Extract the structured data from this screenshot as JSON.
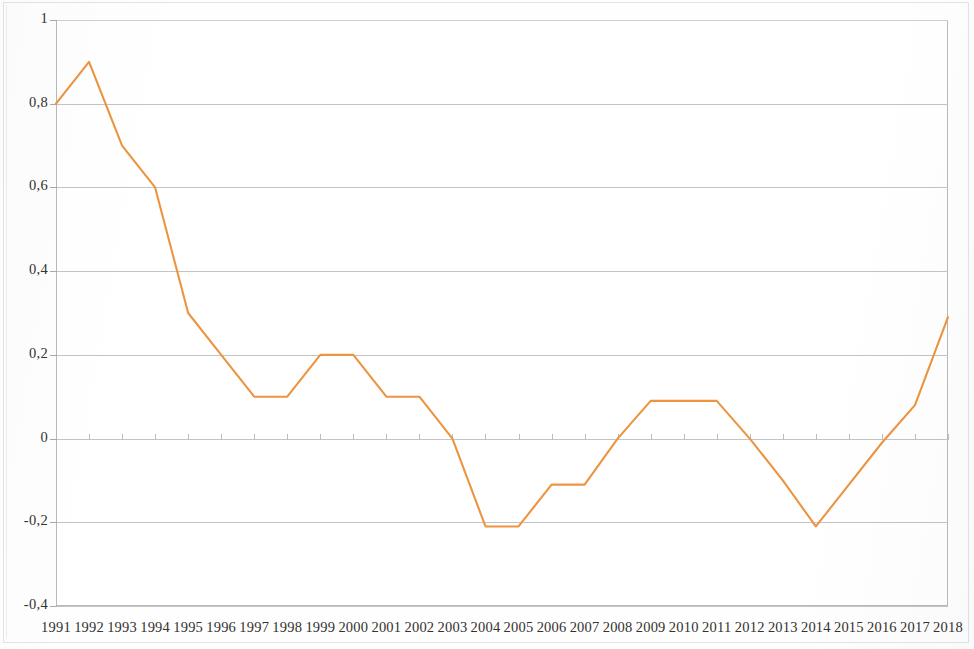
{
  "chart_data": {
    "type": "line",
    "title": "",
    "subtitle": "",
    "xlabel": "",
    "ylabel": "",
    "grid": true,
    "legend": "none",
    "line_color": "#ED9440",
    "categories": [
      "1991",
      "1992",
      "1993",
      "1994",
      "1995",
      "1996",
      "1997",
      "1998",
      "1999",
      "2000",
      "2001",
      "2002",
      "2003",
      "2004",
      "2005",
      "2006",
      "2007",
      "2008",
      "2009",
      "2010",
      "2011",
      "2012",
      "2013",
      "2014",
      "2015",
      "2016",
      "2017",
      "2018"
    ],
    "series": [
      {
        "name": "series-1",
        "values": [
          0.8,
          0.9,
          0.7,
          0.6,
          0.3,
          0.2,
          0.1,
          0.1,
          0.2,
          0.2,
          0.1,
          0.1,
          0.0,
          -0.21,
          -0.21,
          -0.11,
          -0.11,
          0.0,
          0.09,
          0.09,
          0.09,
          0.0,
          -0.1,
          -0.21,
          -0.11,
          -0.01,
          0.08,
          0.29
        ]
      }
    ],
    "ylim": [
      -0.4,
      1.0
    ],
    "ytick_values": [
      1,
      0.8,
      0.6,
      0.4,
      0.2,
      0,
      -0.2,
      -0.4
    ],
    "ytick_labels": [
      "1",
      "0,8",
      "0,6",
      "0,4",
      "0,2",
      "0",
      "-0,2",
      "-0,4"
    ],
    "xtick_labels": [
      "1991",
      "1992",
      "1993",
      "1994",
      "1995",
      "1996",
      "1997",
      "1998",
      "1999",
      "2000",
      "2001",
      "2002",
      "2003",
      "2004",
      "2005",
      "2006",
      "2007",
      "2008",
      "2009",
      "2010",
      "2011",
      "2012",
      "2013",
      "2014",
      "2015",
      "2016",
      "2017",
      "2018"
    ]
  }
}
